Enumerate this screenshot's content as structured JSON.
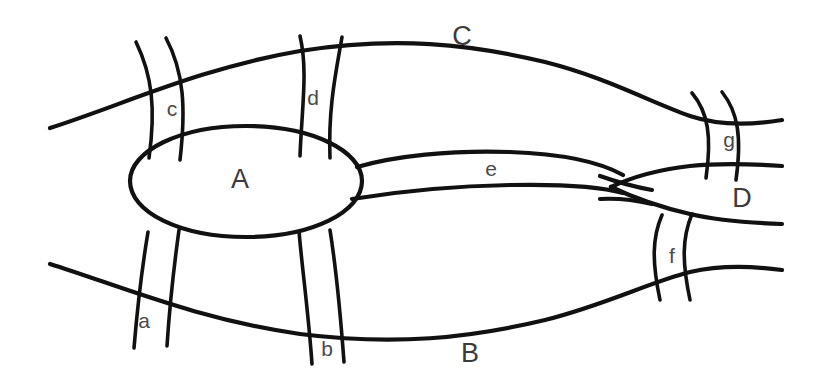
{
  "figure": {
    "kind": "topological-region-bridge-diagram",
    "background_color": "#ffffff",
    "line_color": "#111111",
    "label_color": "#3b3b3b",
    "width": 813,
    "height": 389
  },
  "regions": [
    {
      "id": "A",
      "label": "A",
      "shape": "ellipse",
      "x": 240,
      "y": 181
    },
    {
      "id": "B",
      "label": "B",
      "shape": "lower-band",
      "x": 470,
      "y": 355
    },
    {
      "id": "C",
      "label": "C",
      "shape": "upper-band",
      "x": 462,
      "y": 38
    },
    {
      "id": "D",
      "label": "D",
      "shape": "right-band",
      "x": 742,
      "y": 200
    }
  ],
  "bridges": [
    {
      "id": "a",
      "label": "a",
      "x": 144,
      "y": 322,
      "connects": [
        "A",
        "B"
      ]
    },
    {
      "id": "b",
      "label": "b",
      "x": 327,
      "y": 350,
      "connects": [
        "A",
        "B"
      ]
    },
    {
      "id": "c",
      "label": "c",
      "x": 172,
      "y": 110,
      "connects": [
        "A",
        "C"
      ]
    },
    {
      "id": "d",
      "label": "d",
      "x": 313,
      "y": 99,
      "connects": [
        "A",
        "C"
      ]
    },
    {
      "id": "e",
      "label": "e",
      "x": 491,
      "y": 170,
      "connects": [
        "A",
        "D"
      ]
    },
    {
      "id": "f",
      "label": "f",
      "x": 672,
      "y": 257,
      "connects": [
        "B",
        "D"
      ]
    },
    {
      "id": "g",
      "label": "g",
      "x": 729,
      "y": 141,
      "connects": [
        "C",
        "D"
      ]
    }
  ]
}
